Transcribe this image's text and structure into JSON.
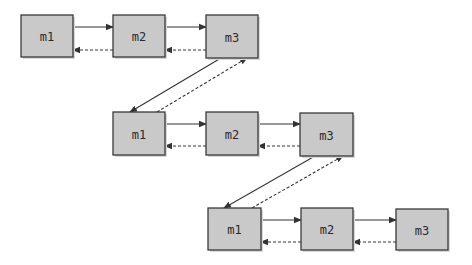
{
  "diagram": {
    "colors": {
      "node_fill": "#c9c9c9",
      "node_stroke": "#3a3a3a",
      "edge": "#333333",
      "background": "#ffffff"
    },
    "rows": [
      {
        "nodes": [
          {
            "id": "r1-m1",
            "label": "m1",
            "x": 21,
            "y": 15,
            "w": 52,
            "h": 42
          },
          {
            "id": "r1-m2",
            "label": "m2",
            "x": 113,
            "y": 15,
            "w": 52,
            "h": 42
          },
          {
            "id": "r1-m3",
            "label": "m3",
            "x": 206,
            "y": 15,
            "w": 52,
            "h": 43
          }
        ]
      },
      {
        "nodes": [
          {
            "id": "r2-m1",
            "label": "m1",
            "x": 113,
            "y": 112,
            "w": 52,
            "h": 43
          },
          {
            "id": "r2-m2",
            "label": "m2",
            "x": 206,
            "y": 112,
            "w": 52,
            "h": 43
          },
          {
            "id": "r2-m3",
            "label": "m3",
            "x": 300,
            "y": 113,
            "w": 53,
            "h": 43
          }
        ]
      },
      {
        "nodes": [
          {
            "id": "r3-m1",
            "label": "m1",
            "x": 208,
            "y": 208,
            "w": 53,
            "h": 42
          },
          {
            "id": "r3-m2",
            "label": "m2",
            "x": 301,
            "y": 208,
            "w": 52,
            "h": 42
          },
          {
            "id": "r3-m3",
            "label": "m3",
            "x": 396,
            "y": 209,
            "w": 52,
            "h": 41
          }
        ]
      }
    ],
    "edges": [
      {
        "from": "r1-m1",
        "to": "r1-m2",
        "style": "solid",
        "x1": 73,
        "y1": 27,
        "x2": 113,
        "y2": 27
      },
      {
        "from": "r1-m2",
        "to": "r1-m1",
        "style": "dashed",
        "x1": 113,
        "y1": 50,
        "x2": 73,
        "y2": 50
      },
      {
        "from": "r1-m2",
        "to": "r1-m3",
        "style": "solid",
        "x1": 165,
        "y1": 27,
        "x2": 206,
        "y2": 27
      },
      {
        "from": "r1-m3",
        "to": "r1-m2",
        "style": "dashed",
        "x1": 206,
        "y1": 50,
        "x2": 165,
        "y2": 50
      },
      {
        "from": "r1-m3",
        "to": "r2-m1",
        "style": "solid",
        "x1": 221,
        "y1": 58,
        "x2": 130,
        "y2": 112
      },
      {
        "from": "r2-m1",
        "to": "r1-m3",
        "style": "dashed",
        "x1": 157,
        "y1": 112,
        "x2": 247,
        "y2": 58
      },
      {
        "from": "r2-m1",
        "to": "r2-m2",
        "style": "solid",
        "x1": 165,
        "y1": 124,
        "x2": 206,
        "y2": 124
      },
      {
        "from": "r2-m2",
        "to": "r2-m1",
        "style": "dashed",
        "x1": 206,
        "y1": 146,
        "x2": 165,
        "y2": 146
      },
      {
        "from": "r2-m2",
        "to": "r2-m3",
        "style": "solid",
        "x1": 258,
        "y1": 124,
        "x2": 300,
        "y2": 124
      },
      {
        "from": "r2-m3",
        "to": "r2-m2",
        "style": "dashed",
        "x1": 300,
        "y1": 146,
        "x2": 258,
        "y2": 146
      },
      {
        "from": "r2-m3",
        "to": "r3-m1",
        "style": "solid",
        "x1": 315,
        "y1": 156,
        "x2": 224,
        "y2": 208
      },
      {
        "from": "r3-m1",
        "to": "r2-m3",
        "style": "dashed",
        "x1": 252,
        "y1": 208,
        "x2": 343,
        "y2": 156
      },
      {
        "from": "r3-m1",
        "to": "r3-m2",
        "style": "solid",
        "x1": 261,
        "y1": 220,
        "x2": 301,
        "y2": 220
      },
      {
        "from": "r3-m2",
        "to": "r3-m1",
        "style": "dashed",
        "x1": 301,
        "y1": 242,
        "x2": 261,
        "y2": 242
      },
      {
        "from": "r3-m2",
        "to": "r3-m3",
        "style": "solid",
        "x1": 353,
        "y1": 220,
        "x2": 396,
        "y2": 220
      },
      {
        "from": "r3-m3",
        "to": "r3-m2",
        "style": "dashed",
        "x1": 396,
        "y1": 242,
        "x2": 353,
        "y2": 242
      }
    ]
  }
}
